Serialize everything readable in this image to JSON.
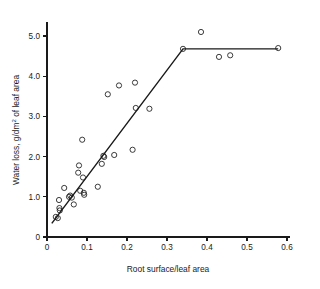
{
  "chart_data": {
    "type": "scatter",
    "title": "",
    "xlabel": "Root surface/leaf area",
    "ylabel_parts": {
      "pre": "Water loss, g/dm",
      "sup": "2",
      "post": " of leaf area"
    },
    "ylabel": "Water loss, g/dm2 of leaf area",
    "xlim": [
      0,
      0.6
    ],
    "ylim": [
      0,
      5.5
    ],
    "xticks": [
      0,
      0.1,
      0.2,
      0.3,
      0.4,
      0.5,
      0.6
    ],
    "xtick_labels": [
      "0",
      "0.1",
      "0.2",
      "0.3",
      "0.4",
      "0.5",
      "0.6"
    ],
    "yticks": [
      0,
      1.0,
      2.0,
      3.0,
      4.0,
      5.0
    ],
    "ytick_labels": [
      "0",
      "1.0",
      "2.0",
      "3.0",
      "4.0",
      "5.0"
    ],
    "grid": false,
    "legend": null,
    "marker": "open-circle",
    "marker_radius_px": 2.6,
    "points": [
      {
        "x": 0.022,
        "y": 0.5
      },
      {
        "x": 0.027,
        "y": 0.47
      },
      {
        "x": 0.03,
        "y": 0.92
      },
      {
        "x": 0.031,
        "y": 0.72
      },
      {
        "x": 0.032,
        "y": 0.66
      },
      {
        "x": 0.043,
        "y": 1.22
      },
      {
        "x": 0.055,
        "y": 1.0
      },
      {
        "x": 0.058,
        "y": 1.03
      },
      {
        "x": 0.062,
        "y": 0.98
      },
      {
        "x": 0.067,
        "y": 0.81
      },
      {
        "x": 0.078,
        "y": 1.6
      },
      {
        "x": 0.08,
        "y": 1.78
      },
      {
        "x": 0.083,
        "y": 1.15
      },
      {
        "x": 0.088,
        "y": 2.42
      },
      {
        "x": 0.09,
        "y": 1.48
      },
      {
        "x": 0.092,
        "y": 1.1
      },
      {
        "x": 0.093,
        "y": 1.05
      },
      {
        "x": 0.127,
        "y": 1.25
      },
      {
        "x": 0.137,
        "y": 1.82
      },
      {
        "x": 0.141,
        "y": 2.02
      },
      {
        "x": 0.143,
        "y": 1.99
      },
      {
        "x": 0.152,
        "y": 3.55
      },
      {
        "x": 0.168,
        "y": 2.04
      },
      {
        "x": 0.18,
        "y": 3.77
      },
      {
        "x": 0.214,
        "y": 2.17
      },
      {
        "x": 0.22,
        "y": 3.84
      },
      {
        "x": 0.222,
        "y": 3.21
      },
      {
        "x": 0.256,
        "y": 3.19
      },
      {
        "x": 0.34,
        "y": 4.68
      },
      {
        "x": 0.385,
        "y": 5.1
      },
      {
        "x": 0.43,
        "y": 4.48
      },
      {
        "x": 0.458,
        "y": 4.52
      },
      {
        "x": 0.578,
        "y": 4.7
      }
    ],
    "fit_line": {
      "type": "two-segment-broken-line",
      "vertices": [
        {
          "x": 0.012,
          "y": 0.34
        },
        {
          "x": 0.34,
          "y": 4.68
        },
        {
          "x": 0.578,
          "y": 4.68
        }
      ]
    },
    "colors": {
      "axis": "#1a1a1a",
      "marker": "#1a1a1a",
      "line": "#1a1a1a",
      "background": "#ffffff"
    }
  }
}
